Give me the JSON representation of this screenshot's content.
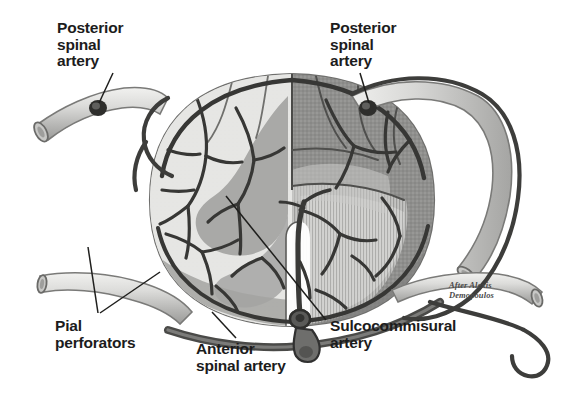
{
  "figure": {
    "credit": "After Alexis\nDemopoulos",
    "palette": {
      "background": "#ffffff",
      "ink": "#1c1c1c",
      "artery_dark": "#3d3d3d",
      "artery_mid": "#5a5a5a",
      "white_matter": "#e2e2e0",
      "gray_matter": "#a9a9a7",
      "surface_hatch_dark": "#8e8e8c",
      "surface_hatch_light": "#bdbdbb",
      "pia_rim": "#9a9a98",
      "vessel_lumen": "#d9d9d7",
      "vessel_wall": "#8a8a88"
    }
  },
  "labels": [
    {
      "id": "posterior-spinal-artery-left",
      "text": "Posterior\nspinal\nartery",
      "side": "left",
      "leader_from": [
        115,
        72
      ],
      "leader_to": [
        97,
        92
      ]
    },
    {
      "id": "posterior-spinal-artery-right",
      "text": "Posterior\nspinal\nartery",
      "side": "right",
      "leader_from": [
        362,
        72
      ],
      "leader_to": [
        352,
        92
      ]
    },
    {
      "id": "pial-perforators",
      "text": "Pial\nperforators",
      "side": "bottom-left",
      "leader_from": [
        100,
        312
      ],
      "leader_to": [
        112,
        245
      ]
    },
    {
      "id": "anterior-spinal-artery",
      "text": "Anterior\nspinal artery",
      "side": "bottom-center",
      "leader_from": [
        238,
        336
      ],
      "leader_to": [
        216,
        312
      ]
    },
    {
      "id": "sulcocommisural-artery",
      "text": "Sulcocommisural\nartery",
      "side": "bottom-right",
      "leader_from": [
        327,
        318
      ],
      "leader_to": [
        226,
        194
      ]
    }
  ],
  "structures": [
    {
      "id": "spinal-cord-section",
      "name": "Spinal cord axial section"
    },
    {
      "id": "white-matter",
      "name": "White matter"
    },
    {
      "id": "gray-matter",
      "name": "Gray matter (butterfly)"
    },
    {
      "id": "anterior-median-fissure",
      "name": "Anterior median fissure"
    },
    {
      "id": "pial-arterial-plexus",
      "name": "Pial arterial plexus"
    },
    {
      "id": "cut-vessel-upper-left",
      "name": "Cut radicular vessel, upper left"
    },
    {
      "id": "cut-vessel-lower-left",
      "name": "Cut radicular vessel, lower left"
    },
    {
      "id": "cut-vessel-upper-right",
      "name": "Cut radicular vessel, upper right"
    },
    {
      "id": "cut-vessel-lower-right",
      "name": "Cut radicular vessel, lower right"
    }
  ]
}
